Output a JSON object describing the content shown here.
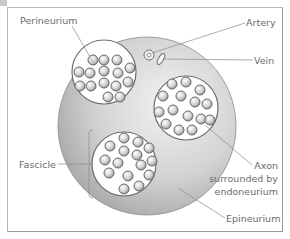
{
  "diagram": {
    "type": "nerve-cross-section",
    "labels": {
      "perineurium": "Perineurium",
      "artery": "Artery",
      "vein": "Vein",
      "fascicle": "Fascicle",
      "axon_line1": "Axon",
      "axon_line2": "surrounded by",
      "axon_line3": "endoneurium",
      "epineurium": "Epineurium"
    },
    "colors": {
      "epineurium_fill_light": "#eeeeee",
      "epineurium_fill_dark": "#a8a8a8",
      "fascicle_fill": "#ffffff",
      "outline": "#6e6e6e",
      "leader_line": "#8a8a8a",
      "label_text": "#6b6b6b",
      "frame": "#9a9a9a"
    }
  }
}
